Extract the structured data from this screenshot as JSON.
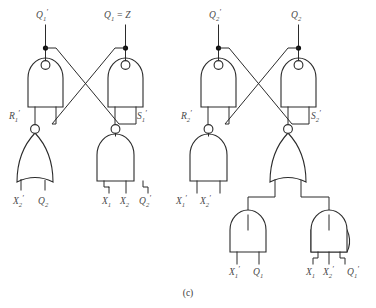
{
  "figure": {
    "caption": "(c)",
    "line_color": "#2b2b2b",
    "label_color": "#4a4a4a",
    "background": "#ffffff"
  },
  "latches": [
    {
      "name": "latch-1",
      "output_labels": [
        {
          "id": "q1-not",
          "base": "Q",
          "sub": "1",
          "prime": true,
          "text": "Q′1"
        },
        {
          "id": "q1-equals-z",
          "base": "Q",
          "sub": "1",
          "prime": false,
          "suffix": " = Z",
          "text": "Q1 = Z"
        }
      ],
      "cross_gates": [
        {
          "id": "nand-q1-not",
          "type": "NAND",
          "output": "Q′1"
        },
        {
          "id": "nand-q1",
          "type": "NAND",
          "output": "Q1"
        }
      ],
      "drive_labels": [
        {
          "id": "r1-not",
          "base": "R",
          "sub": "1",
          "prime": true,
          "text": "R′1"
        },
        {
          "id": "s1-not",
          "base": "S",
          "sub": "1",
          "prime": true,
          "text": "S′1"
        }
      ],
      "input_gates": [
        {
          "id": "nor-r1",
          "type": "NOR",
          "feeds": "R′1",
          "inputs": [
            {
              "base": "X",
              "sub": "2",
              "prime": true,
              "text": "X′2"
            },
            {
              "base": "Q",
              "sub": "2",
              "prime": false,
              "text": "Q2"
            }
          ]
        },
        {
          "id": "nand-s1",
          "type": "NAND",
          "feeds": "S′1",
          "inputs": [
            {
              "base": "X",
              "sub": "1",
              "prime": false,
              "text": "X1"
            },
            {
              "base": "X",
              "sub": "2",
              "prime": false,
              "text": "X2"
            },
            {
              "base": "Q",
              "sub": "2",
              "prime": true,
              "text": "Q′2"
            }
          ]
        }
      ]
    },
    {
      "name": "latch-2",
      "output_labels": [
        {
          "id": "q2-not",
          "base": "Q",
          "sub": "2",
          "prime": true,
          "text": "Q′2"
        },
        {
          "id": "q2",
          "base": "Q",
          "sub": "2",
          "prime": false,
          "text": "Q2"
        }
      ],
      "cross_gates": [
        {
          "id": "nand-q2-not",
          "type": "NAND",
          "output": "Q′2"
        },
        {
          "id": "nand-q2",
          "type": "NAND",
          "output": "Q2"
        }
      ],
      "drive_labels": [
        {
          "id": "r2-not",
          "base": "R",
          "sub": "2",
          "prime": true,
          "text": "R′2"
        },
        {
          "id": "s2-not",
          "base": "S",
          "sub": "2",
          "prime": true,
          "text": "S′2"
        }
      ],
      "input_gates": [
        {
          "id": "nand-r2",
          "type": "NAND",
          "feeds": "R′2",
          "inputs": [
            {
              "base": "X",
              "sub": "1",
              "prime": true,
              "text": "X′1"
            },
            {
              "base": "X",
              "sub": "2",
              "prime": true,
              "text": "X′2"
            }
          ]
        },
        {
          "id": "nor-s2",
          "type": "NOR",
          "feeds": "S′2",
          "inputs": []
        }
      ],
      "and_gates": [
        {
          "id": "and-left",
          "type": "AND",
          "inputs": [
            {
              "base": "X",
              "sub": "1",
              "prime": true,
              "text": "X′1"
            },
            {
              "base": "Q",
              "sub": "1",
              "prime": false,
              "text": "Q1"
            }
          ]
        },
        {
          "id": "and-right",
          "type": "AND",
          "inputs": [
            {
              "base": "X",
              "sub": "1",
              "prime": false,
              "text": "X1"
            },
            {
              "base": "X",
              "sub": "2",
              "prime": true,
              "text": "X′2"
            },
            {
              "base": "Q",
              "sub": "1",
              "prime": true,
              "text": "Q′1"
            }
          ]
        }
      ]
    }
  ],
  "labels": {
    "top": [
      {
        "id": "top-q1-not",
        "x": 44,
        "y": 16,
        "base": "Q",
        "sub": "1",
        "prime": true,
        "suffix": ""
      },
      {
        "id": "top-q1-z",
        "x": 106,
        "y": 16,
        "base": "Q",
        "sub": "1",
        "prime": false,
        "suffix": " = Z"
      },
      {
        "id": "top-q2-not",
        "x": 213,
        "y": 16,
        "base": "Q",
        "sub": "2",
        "prime": true,
        "suffix": ""
      },
      {
        "id": "top-q2",
        "x": 288,
        "y": 16,
        "base": "Q",
        "sub": "2",
        "prime": false,
        "suffix": ""
      }
    ],
    "mid": [
      {
        "id": "mid-r1",
        "x": 11,
        "y": 116,
        "base": "R",
        "sub": "1",
        "prime": true
      },
      {
        "id": "mid-s1",
        "x": 136,
        "y": 116,
        "base": "S",
        "sub": "1",
        "prime": true
      },
      {
        "id": "mid-r2",
        "x": 184,
        "y": 116,
        "base": "R",
        "sub": "2",
        "prime": true
      },
      {
        "id": "mid-s2",
        "x": 310,
        "y": 116,
        "base": "S",
        "sub": "2",
        "prime": true
      }
    ],
    "bottom": [
      {
        "id": "in-x2-not-a",
        "x": 15,
        "y": 201,
        "base": "X",
        "sub": "2",
        "prime": true
      },
      {
        "id": "in-q2-a",
        "x": 38,
        "y": 201,
        "base": "Q",
        "sub": "2",
        "prime": false
      },
      {
        "id": "in-x1-b",
        "x": 105,
        "y": 201,
        "base": "X",
        "sub": "1",
        "prime": false
      },
      {
        "id": "in-x2-b",
        "x": 126,
        "y": 201,
        "base": "X",
        "sub": "2",
        "prime": false
      },
      {
        "id": "in-q2-not-b",
        "x": 148,
        "y": 201,
        "base": "Q",
        "sub": "2",
        "prime": true
      },
      {
        "id": "in-x1-not-c",
        "x": 178,
        "y": 201,
        "base": "X",
        "sub": "1",
        "prime": true
      },
      {
        "id": "in-x2-not-c",
        "x": 203,
        "y": 201,
        "base": "X",
        "sub": "2",
        "prime": true
      },
      {
        "id": "in-x1-not-d",
        "x": 251,
        "y": 272,
        "base": "X",
        "sub": "1",
        "prime": true
      },
      {
        "id": "in-q1-d",
        "x": 275,
        "y": 272,
        "base": "Q",
        "sub": "1",
        "prime": false
      },
      {
        "id": "in-x1-e",
        "x": 309,
        "y": 272,
        "base": "X",
        "sub": "1",
        "prime": false
      },
      {
        "id": "in-x2-not-e",
        "x": 329,
        "y": 272,
        "base": "X",
        "sub": "2",
        "prime": true
      },
      {
        "id": "in-q1-not-e",
        "x": 353,
        "y": 272,
        "base": "Q",
        "sub": "1",
        "prime": true
      }
    ]
  }
}
